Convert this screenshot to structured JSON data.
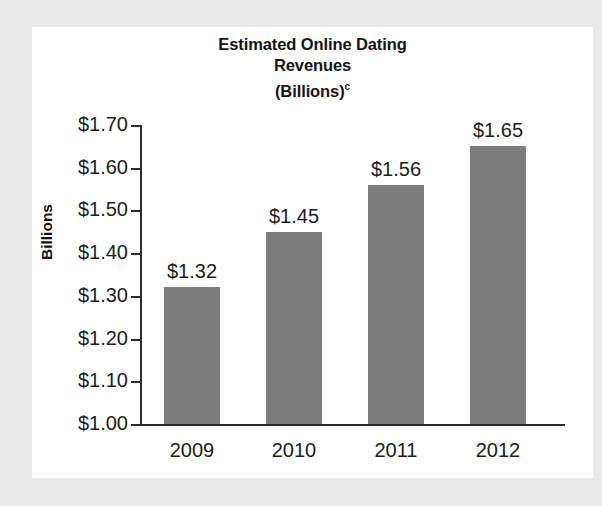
{
  "chart_data": {
    "type": "bar",
    "title": "Estimated Online Dating Revenues (Billions)",
    "title_lines": [
      "Estimated Online Dating",
      "Revenues",
      "(Billions)"
    ],
    "title_footnote_marker": "c",
    "categories": [
      "2009",
      "2010",
      "2011",
      "2012"
    ],
    "values": [
      1.32,
      1.45,
      1.56,
      1.65
    ],
    "value_labels": [
      "$1.32",
      "$1.45",
      "$1.56",
      "$1.65"
    ],
    "xlabel": "",
    "ylabel": "Billions",
    "ylim": [
      1.0,
      1.7
    ],
    "ytick_values": [
      1.7,
      1.6,
      1.5,
      1.4,
      1.3,
      1.2,
      1.1,
      1.0
    ],
    "ytick_labels": [
      "$1.70",
      "$1.60",
      "$1.50",
      "$1.40",
      "$1.30",
      "$1.20",
      "$1.10",
      "$1.00"
    ],
    "grid": false,
    "legend": false,
    "legend_position": "none",
    "bar_color": "#7d7d7d",
    "axis_color": "#2b2b2b",
    "plot_background": "#ffffff",
    "page_background": "#ededed",
    "text_color": "#1c1c1c"
  }
}
